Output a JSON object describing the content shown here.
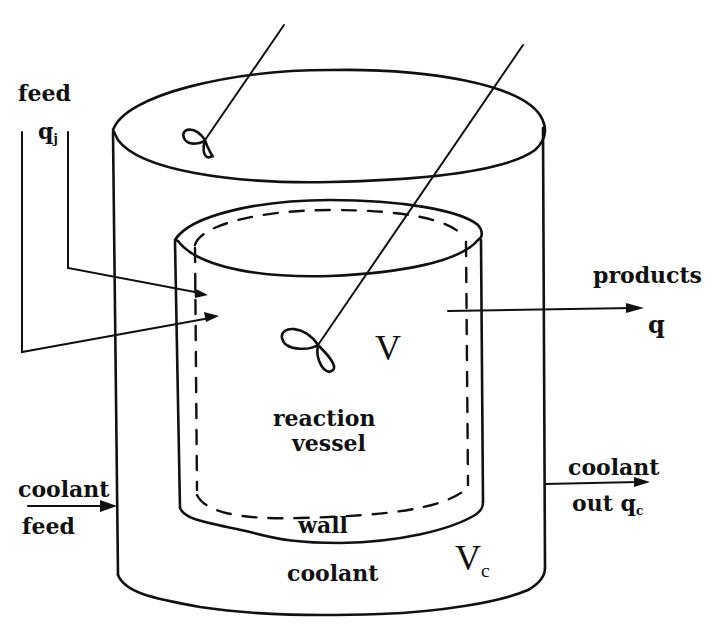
{
  "diagram": {
    "type": "jacketed-reactor-schematic",
    "style": "hand-drawn line art",
    "colors": {
      "ink": "#111111",
      "background": "#ffffff"
    },
    "labels": {
      "feed_top": "feed",
      "feed_flow": "q",
      "feed_flow_sub": "j",
      "products": "products",
      "products_flow": "q",
      "reactor_volume": "V",
      "reaction_vessel_line1": "reaction",
      "reaction_vessel_line2": "vessel",
      "coolant_feed_line1": "coolant",
      "coolant_feed_line2": "feed",
      "coolant_out_line1": "coolant",
      "coolant_out_line2": "out",
      "coolant_out_flow": "q",
      "coolant_out_flow_sub": "c",
      "wall": "wall",
      "jacket_coolant": "coolant",
      "jacket_volume": "V",
      "jacket_volume_sub": "c"
    },
    "components": [
      "outer-jacket-cylinder",
      "inner-reaction-vessel",
      "vessel-wall-dashed-line",
      "jacket-stirrer",
      "reactor-stirrer",
      "feed-inlet-arrows",
      "products-outlet-arrow",
      "coolant-feed-arrow",
      "coolant-out-arrow"
    ]
  }
}
